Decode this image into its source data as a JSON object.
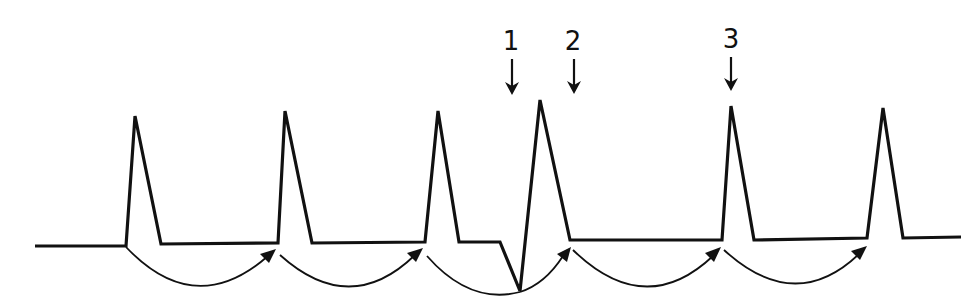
{
  "figure": {
    "line_color": "#111111",
    "background": "#ffffff"
  },
  "markers": [
    {
      "label": "1",
      "x": 511
    },
    {
      "label": "2",
      "x": 573
    },
    {
      "label": "3",
      "x": 731
    }
  ],
  "trace_points": "35,246 126,246 135,116 161,244 278,243 285,111 312,243 425,242 438,111 459,242 500,242 520,291 540,100 570,240 722,240 731,106 754,240 867,238 883,108 903,238 961,237",
  "interval_arcs": [
    {
      "from": 126,
      "to": 275,
      "arrow": true
    },
    {
      "from": 279,
      "to": 422,
      "arrow": true
    },
    {
      "from": 427,
      "to": 520,
      "arrow": false
    },
    {
      "from": 520,
      "to": 569,
      "arrow": true
    },
    {
      "from": 572,
      "to": 720,
      "arrow": true
    },
    {
      "from": 723,
      "to": 866,
      "arrow": true
    }
  ]
}
